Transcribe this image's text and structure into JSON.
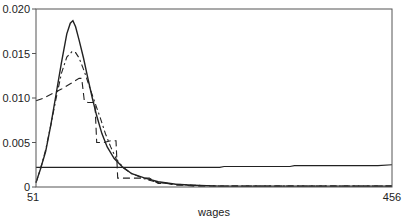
{
  "chart_data": {
    "type": "line",
    "title": "",
    "xlabel": "wages",
    "ylabel": "",
    "xlim": [
      51,
      456
    ],
    "ylim": [
      0,
      0.02
    ],
    "grid": false,
    "legend": null,
    "x_tick_labels": [
      "51",
      "456"
    ],
    "y_tick_labels": [
      "0",
      "0.005",
      "0.010",
      "0.015",
      "0.020"
    ],
    "y_ticks": [
      0,
      0.005,
      0.01,
      0.015,
      0.02
    ],
    "series": [
      {
        "name": "solid-density",
        "style": "solid",
        "x": [
          51,
          56,
          62,
          68,
          74,
          80,
          86,
          90,
          93,
          96,
          100,
          105,
          110,
          115,
          120,
          126,
          132,
          140,
          150,
          160,
          175,
          190,
          210,
          230,
          260,
          300,
          350,
          400,
          456
        ],
        "y": [
          0.0005,
          0.002,
          0.004,
          0.007,
          0.0105,
          0.014,
          0.0172,
          0.0184,
          0.0187,
          0.018,
          0.0165,
          0.0145,
          0.0122,
          0.01,
          0.008,
          0.006,
          0.0045,
          0.0032,
          0.0022,
          0.0015,
          0.001,
          0.0006,
          0.0003,
          0.0002,
          0.0001,
          0.0001,
          0.0001,
          0.0001,
          0.0001
        ]
      },
      {
        "name": "dash-dot-density",
        "style": "dashdot",
        "x": [
          51,
          56,
          62,
          68,
          74,
          80,
          86,
          92,
          96,
          100,
          106,
          112,
          118,
          124,
          130,
          136,
          142,
          150,
          160,
          175,
          190,
          210,
          230,
          260,
          300,
          350,
          400,
          456
        ],
        "y": [
          0.0005,
          0.002,
          0.0042,
          0.007,
          0.01,
          0.0128,
          0.0146,
          0.0152,
          0.0151,
          0.0145,
          0.013,
          0.0112,
          0.0095,
          0.0078,
          0.006,
          0.0045,
          0.0032,
          0.0022,
          0.0015,
          0.0009,
          0.0005,
          0.0003,
          0.0002,
          0.0001,
          0.0001,
          0.0001,
          0.0001,
          0.0001
        ]
      },
      {
        "name": "dashed-density",
        "style": "dashed",
        "x": [
          51,
          60,
          70,
          80,
          90,
          100,
          103,
          106,
          110,
          118,
          120,
          128,
          136,
          142,
          144,
          150,
          160,
          170,
          180,
          190,
          200,
          210,
          220,
          230,
          260,
          300,
          350,
          400,
          456
        ],
        "y": [
          0.0097,
          0.01,
          0.0105,
          0.011,
          0.0116,
          0.0122,
          0.0122,
          0.0097,
          0.0095,
          0.0095,
          0.005,
          0.005,
          0.0052,
          0.0052,
          0.001,
          0.001,
          0.001,
          0.001,
          0.001,
          0.0004,
          0.0004,
          0.0002,
          0.0002,
          0.0001,
          0.0001,
          0.0001,
          0.0001,
          0.0001,
          0.0001
        ]
      },
      {
        "name": "flat-density",
        "style": "solid",
        "x": [
          51,
          100,
          150,
          200,
          260,
          265,
          300,
          340,
          345,
          400,
          440,
          456
        ],
        "y": [
          0.0022,
          0.0022,
          0.0022,
          0.0022,
          0.0022,
          0.0023,
          0.0023,
          0.0023,
          0.0024,
          0.0024,
          0.0024,
          0.0025
        ]
      }
    ]
  },
  "axes": {
    "xlabel": "wages",
    "x_min_label": "51",
    "x_max_label": "456",
    "y_labels": [
      "0",
      "0.005",
      "0.010",
      "0.015",
      "0.020"
    ]
  }
}
